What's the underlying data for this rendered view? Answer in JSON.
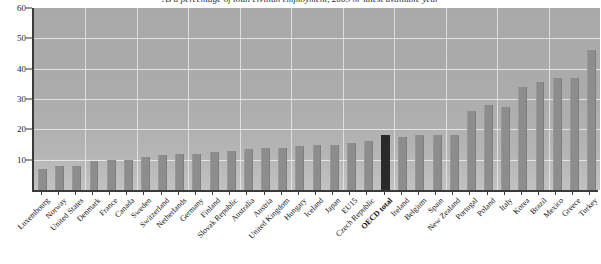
{
  "chart_data": {
    "type": "bar",
    "title": "As a percentage of total civilian employment, 2003 or latest available year",
    "xlabel": "",
    "ylabel": "",
    "ylim": [
      0,
      60
    ],
    "yticks": [
      10,
      20,
      30,
      40,
      50,
      60
    ],
    "grid": true,
    "legend": null,
    "highlight_category": "OECD total",
    "highlight_color": "#2a2a2a",
    "bar_color": "#8d8d8d",
    "plot_background": "#ababab",
    "gridline_color": "#ededed",
    "categories": [
      "Luxembourg",
      "Norway",
      "United States",
      "Denmark",
      "France",
      "Canada",
      "Sweden",
      "Switzerland",
      "Netherlands",
      "Germany",
      "Finland",
      "Slovak Republic",
      "Australia",
      "Austria",
      "United Kingdom",
      "Hungary",
      "Iceland",
      "Japan",
      "EU15",
      "Czech Republic",
      "OECD total",
      "Ireland",
      "Belgium",
      "Spain",
      "New Zealand",
      "Portugal",
      "Poland",
      "Italy",
      "Korea",
      "Brazil",
      "Mexico",
      "Greece",
      "Turkey"
    ],
    "values": [
      7,
      8,
      8,
      9.5,
      10,
      10,
      11,
      11.5,
      12,
      12,
      12.5,
      13,
      13.5,
      14,
      14,
      14.5,
      15,
      15,
      15.5,
      16,
      18,
      17.5,
      18,
      18,
      18,
      26,
      28,
      27.5,
      34,
      35.5,
      37,
      37,
      46
    ]
  },
  "yaxis": {
    "labels": [
      "60",
      "50",
      "40",
      "30",
      "20",
      "10"
    ]
  }
}
